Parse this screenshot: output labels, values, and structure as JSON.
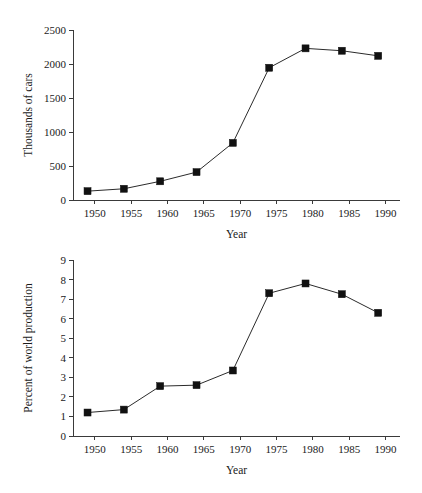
{
  "figure": {
    "background_color": "#ffffff",
    "marker_color": "#111111",
    "line_color": "#2b2b2b",
    "axis_color": "#3a3a3a",
    "panel_count": 2
  },
  "chart_data": [
    {
      "id": "cars-produced",
      "type": "line",
      "title": "",
      "xlabel": "Year",
      "ylabel": "Thousands of cars",
      "x": [
        1949,
        1954,
        1959,
        1964,
        1969,
        1974,
        1979,
        1984,
        1989
      ],
      "values": [
        130,
        165,
        275,
        410,
        840,
        1945,
        2230,
        2195,
        2120
      ],
      "xlim": [
        1947,
        1992
      ],
      "ylim": [
        0,
        2500
      ],
      "xticks": [
        1950,
        1955,
        1960,
        1965,
        1970,
        1975,
        1980,
        1985,
        1990
      ],
      "xticklabels": [
        "1950",
        "1955",
        "1960",
        "1965",
        "1970",
        "1975",
        "1980",
        "1985",
        "1990"
      ],
      "yticks": [
        0,
        500,
        1000,
        1500,
        2000,
        2500
      ],
      "yticklabels": [
        "0",
        "500",
        "1000",
        "1500",
        "2000",
        "2500"
      ],
      "grid": false,
      "legend": "none",
      "marker": "square"
    },
    {
      "id": "percent-world-production",
      "type": "line",
      "title": "",
      "xlabel": "Year",
      "ylabel": "Percent of world production",
      "x": [
        1949,
        1954,
        1959,
        1964,
        1969,
        1974,
        1979,
        1984,
        1989
      ],
      "values": [
        1.2,
        1.35,
        2.55,
        2.6,
        3.35,
        7.3,
        7.8,
        7.25,
        6.3
      ],
      "xlim": [
        1947,
        1992
      ],
      "ylim": [
        0,
        9
      ],
      "xticks": [
        1950,
        1955,
        1960,
        1965,
        1970,
        1975,
        1980,
        1985,
        1990
      ],
      "xticklabels": [
        "1950",
        "1955",
        "1960",
        "1965",
        "1970",
        "1975",
        "1980",
        "1985",
        "1990"
      ],
      "yticks": [
        0,
        1,
        2,
        3,
        4,
        5,
        6,
        7,
        8,
        9
      ],
      "yticklabels": [
        "0",
        "1",
        "2",
        "3",
        "4",
        "5",
        "6",
        "7",
        "8",
        "9"
      ],
      "grid": false,
      "legend": "none",
      "marker": "square"
    }
  ]
}
